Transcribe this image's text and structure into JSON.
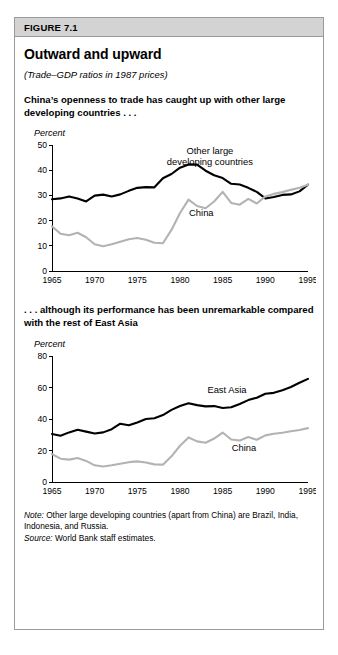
{
  "figure": {
    "label": "FIGURE 7.1",
    "title": "Outward and upward",
    "subtitle": "(Trade–GDP ratios in 1987 prices)",
    "panel1_caption": "China’s openness to trade has caught up with other large developing countries . . .",
    "panel2_caption": ". . . although its performance has been unremarkable compared with the rest of East Asia",
    "note_prefix": "Note:",
    "note_text": " Other large developing countries (apart from China) are Brazil, India, Indonesia, and Russia.",
    "source_prefix": "Source:",
    "source_text": " World Bank staff estimates.",
    "colors": {
      "dark_series": "#000000",
      "light_series": "#b3b3b3",
      "header_band": "#d3d3d3",
      "frame": "#9a9a9a"
    }
  },
  "chart_data": [
    {
      "type": "line",
      "title": "China’s openness to trade has caught up with other large developing countries . . .",
      "xlabel": "",
      "ylabel": "Percent",
      "ylim": [
        0,
        50
      ],
      "xlim": [
        1965,
        1995
      ],
      "yticks": [
        0,
        10,
        20,
        30,
        40,
        50
      ],
      "xticks": [
        1965,
        1970,
        1975,
        1980,
        1985,
        1990,
        1995
      ],
      "grid": false,
      "legend_position": "inline-annotation",
      "x": [
        1965,
        1966,
        1967,
        1968,
        1969,
        1970,
        1971,
        1972,
        1973,
        1974,
        1975,
        1976,
        1977,
        1978,
        1979,
        1980,
        1981,
        1982,
        1983,
        1984,
        1985,
        1986,
        1987,
        1988,
        1989,
        1990,
        1991,
        1992,
        1993,
        1994,
        1995
      ],
      "series": [
        {
          "name": "Other large developing countries",
          "color": "#000000",
          "values": [
            28.5,
            28.8,
            29.6,
            28.8,
            27.6,
            29.9,
            30.3,
            29.6,
            30.4,
            31.8,
            33.0,
            33.3,
            33.2,
            36.8,
            38.5,
            41.0,
            42.3,
            42.2,
            39.8,
            38.0,
            36.9,
            34.6,
            34.3,
            33.0,
            31.4,
            28.8,
            29.4,
            30.2,
            30.4,
            31.6,
            34.3
          ],
          "label_text": "Other large\ndeveloping countries",
          "label_x": 1983.5,
          "label_y": 46.5
        },
        {
          "name": "China",
          "color": "#b3b3b3",
          "values": [
            17.7,
            14.8,
            14.2,
            15.2,
            13.4,
            10.6,
            9.8,
            10.6,
            11.6,
            12.6,
            13.1,
            12.4,
            11.2,
            11.0,
            16.3,
            23.0,
            28.3,
            25.8,
            24.9,
            27.6,
            31.4,
            27.0,
            26.3,
            28.6,
            26.8,
            29.6,
            30.6,
            31.3,
            32.2,
            33.0,
            34.2
          ],
          "label_text": "China",
          "label_x": 1982.5,
          "label_y": 22.0
        }
      ]
    },
    {
      "type": "line",
      "title": ". . . although its performance has been unremarkable compared with the rest of East Asia",
      "xlabel": "",
      "ylabel": "Percent",
      "ylim": [
        0,
        80
      ],
      "xlim": [
        1965,
        1995
      ],
      "yticks": [
        0,
        20,
        40,
        60,
        80
      ],
      "xticks": [
        1965,
        1970,
        1975,
        1980,
        1985,
        1990,
        1995
      ],
      "grid": false,
      "legend_position": "inline-annotation",
      "x": [
        1965,
        1966,
        1967,
        1968,
        1969,
        1970,
        1971,
        1972,
        1973,
        1974,
        1975,
        1976,
        1977,
        1978,
        1979,
        1980,
        1981,
        1982,
        1983,
        1984,
        1985,
        1986,
        1987,
        1988,
        1989,
        1990,
        1991,
        1992,
        1993,
        1994,
        1995
      ],
      "series": [
        {
          "name": "East Asia",
          "color": "#000000",
          "values": [
            30.5,
            29.4,
            31.5,
            33.2,
            32.0,
            30.8,
            31.5,
            33.5,
            37.0,
            36.0,
            37.8,
            40.0,
            40.5,
            42.5,
            45.8,
            48.2,
            50.0,
            48.8,
            48.0,
            48.2,
            47.0,
            47.5,
            49.5,
            52.0,
            53.5,
            56.0,
            56.6,
            58.2,
            60.3,
            63.0,
            65.5
          ],
          "label_text": "East Asia",
          "label_x": 1985.5,
          "label_y": 56.5
        },
        {
          "name": "China",
          "color": "#b3b3b3",
          "values": [
            17.7,
            14.8,
            14.2,
            15.2,
            13.4,
            10.6,
            9.8,
            10.6,
            11.6,
            12.6,
            13.1,
            12.4,
            11.2,
            11.0,
            16.3,
            23.0,
            28.3,
            25.8,
            24.9,
            27.6,
            31.4,
            27.0,
            26.3,
            28.6,
            26.8,
            29.6,
            30.6,
            31.3,
            32.2,
            33.0,
            34.2
          ],
          "label_text": "China",
          "label_x": 1987.5,
          "label_y": 20.0
        }
      ]
    }
  ]
}
